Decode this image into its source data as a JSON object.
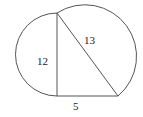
{
  "diagram": {
    "labels": {
      "vertical_leg": "12",
      "hypotenuse": "13",
      "horizontal_leg": "5"
    },
    "colors": {
      "line": "#555555",
      "text": "#222222",
      "background": "#ffffff"
    }
  }
}
